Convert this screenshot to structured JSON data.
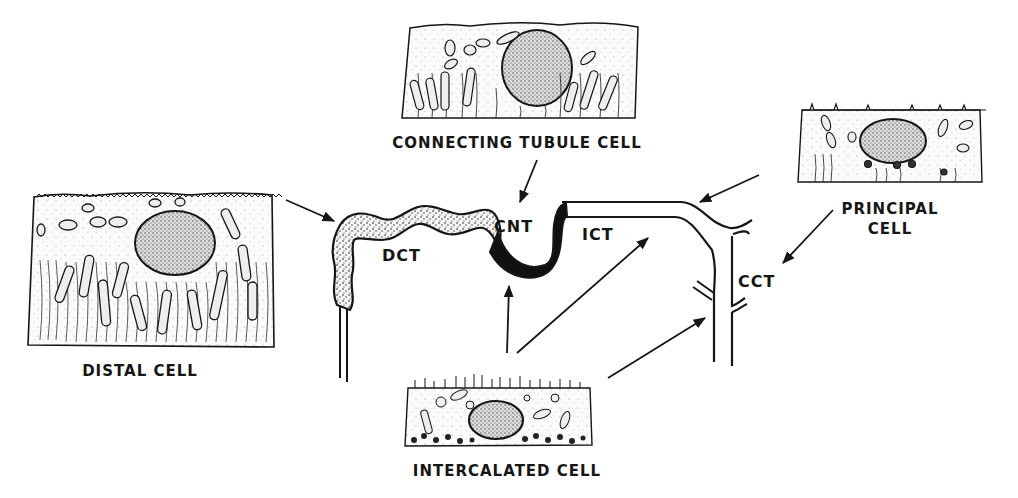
{
  "diagram": {
    "type": "nephron-segment-schematic",
    "colors": {
      "ink": "#161616",
      "background": "#ffffff",
      "dct_fill": "#f2f2f2",
      "cnt_fill": "#111111"
    },
    "segments": [
      {
        "id": "dct",
        "label": "DCT",
        "style": "stippled"
      },
      {
        "id": "cnt",
        "label": "CNT",
        "style": "solid-black"
      },
      {
        "id": "ict",
        "label": "ICT",
        "style": "outline"
      },
      {
        "id": "cct",
        "label": "CCT",
        "style": "outline"
      }
    ],
    "cells": [
      {
        "id": "distal",
        "label": "DISTAL CELL",
        "points_to": [
          "dct"
        ]
      },
      {
        "id": "connecting",
        "label": "CONNECTING TUBULE CELL",
        "points_to": [
          "cnt"
        ]
      },
      {
        "id": "principal",
        "label_line1": "PRINCIPAL",
        "label_line2": "CELL",
        "points_to": [
          "ict",
          "cct"
        ]
      },
      {
        "id": "intercalated",
        "label": "INTERCALATED CELL",
        "points_to": [
          "cnt",
          "ict",
          "cct"
        ]
      }
    ]
  }
}
